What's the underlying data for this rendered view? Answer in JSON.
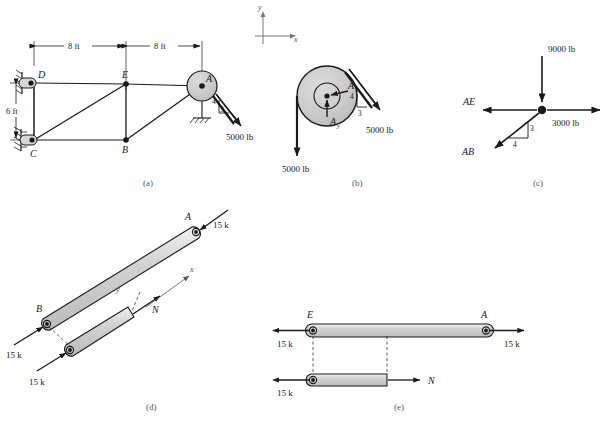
{
  "sheet": {
    "title": "Truss with pulley — free-body diagram set",
    "colors": {
      "line": "#1a1a1a",
      "member_fill": "#c8c8c8",
      "member_fill_light": "#d9d9d9",
      "caption": "#555555",
      "dim": "#1a1a1a",
      "background": "#ffffff"
    }
  },
  "axes_indicator": {
    "name": "global-axes",
    "y_label": "y",
    "x_label": "x"
  },
  "figures": [
    {
      "id": "a",
      "caption": "(a)",
      "description": "Truss DECB with pulley at A carrying a 5000 lb cable load",
      "dimensions": [
        {
          "label": "8 ft",
          "orientation": "horizontal",
          "span": "D to E"
        },
        {
          "label": "8 ft",
          "orientation": "horizontal",
          "span": "E to A"
        },
        {
          "label": "6 ft",
          "orientation": "vertical",
          "span": "C to D"
        }
      ],
      "joints": [
        {
          "label": "D",
          "support": "pin-hatched"
        },
        {
          "label": "C",
          "support": "pin-hatched"
        },
        {
          "label": "E",
          "support": "none"
        },
        {
          "label": "B",
          "support": "none"
        },
        {
          "label": "A",
          "support": "pulley-hub"
        }
      ],
      "ground_support": "hatched-ground",
      "slope_triangle": {
        "vertical": "4",
        "horizontal": "3"
      },
      "load": {
        "label": "5000 lb",
        "direction": "down-right"
      }
    },
    {
      "id": "b",
      "caption": "(b)",
      "description": "Free-body diagram of the pulley at A",
      "reactions": [
        {
          "label": "A",
          "sub": "x",
          "direction": "right"
        },
        {
          "label": "A",
          "sub": "y",
          "direction": "up"
        }
      ],
      "slope_triangle": {
        "vertical": "4",
        "horizontal": "3"
      },
      "loads": [
        {
          "label": "5000 lb",
          "direction": "down",
          "position": "left-tangent"
        },
        {
          "label": "5000 lb",
          "direction": "down-right",
          "position": "right-tangent"
        }
      ]
    },
    {
      "id": "c",
      "caption": "(c)",
      "description": "Free-body diagram of joint A",
      "members": [
        {
          "label": "AE",
          "direction": "left"
        },
        {
          "label": "AB",
          "direction": "down-left"
        }
      ],
      "slope_triangle": {
        "vertical": "3",
        "horizontal": "4"
      },
      "loads": [
        {
          "label": "9000 lb",
          "direction": "down"
        },
        {
          "label": "3000 lb",
          "direction": "right"
        }
      ]
    },
    {
      "id": "d",
      "caption": "(d)",
      "description": "Member AB in tension with section cut showing internal normal force N",
      "joints": [
        {
          "label": "A",
          "position": "upper-right"
        },
        {
          "label": "B",
          "position": "lower-left"
        }
      ],
      "axes": {
        "x_label": "x",
        "y_label": "y"
      },
      "internal_force": {
        "label": "N"
      },
      "loads": [
        {
          "label": "15 k",
          "position": "top-right"
        },
        {
          "label": "15 k",
          "position": "mid-left"
        },
        {
          "label": "15 k",
          "position": "bottom-left"
        }
      ]
    },
    {
      "id": "e",
      "caption": "(e)",
      "description": "Member EA in tension with section cut showing internal normal force N",
      "joints": [
        {
          "label": "E",
          "position": "left"
        },
        {
          "label": "A",
          "position": "right"
        }
      ],
      "internal_force": {
        "label": "N"
      },
      "loads": [
        {
          "label": "15 k",
          "position": "upper-left"
        },
        {
          "label": "15 k",
          "position": "upper-right"
        },
        {
          "label": "15 k",
          "position": "lower-left"
        }
      ]
    }
  ]
}
